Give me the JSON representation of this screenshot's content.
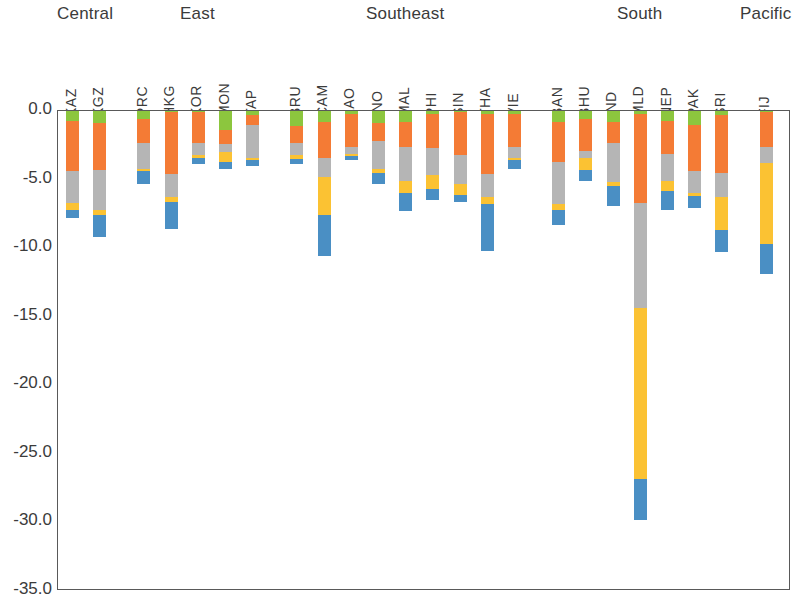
{
  "chart_data": {
    "type": "bar",
    "subtype": "stacked-bar-negative",
    "title": "",
    "xlabel": "",
    "ylabel": "",
    "ylim": [
      -35.0,
      0.0
    ],
    "ytick_labels": [
      "0.0",
      "-5.0",
      "-10.0",
      "-15.0",
      "-20.0",
      "-25.0",
      "-30.0",
      "-35.0"
    ],
    "ytick_values": [
      0.0,
      -5.0,
      -10.0,
      -15.0,
      -20.0,
      -25.0,
      -30.0,
      -35.0
    ],
    "grid": false,
    "legend": "none",
    "orientation": "vertical",
    "stack_order_top_to_bottom": [
      "green",
      "orange",
      "gray",
      "yellow",
      "blue"
    ],
    "colors": {
      "green": "#8CC63E",
      "orange": "#F47B35",
      "gray": "#B5B5B5",
      "yellow": "#FBC233",
      "blue": "#4A8FC4"
    },
    "groups": [
      {
        "label": "Central",
        "categories": [
          "KAZ",
          "KGZ"
        ]
      },
      {
        "label": "East",
        "categories": [
          "PRC",
          "HKG",
          "KOR",
          "MON",
          "TAP"
        ]
      },
      {
        "label": "Southeast",
        "categories": [
          "BRU",
          "CAM",
          "LAO",
          "INO",
          "MAL",
          "PHI",
          "SIN",
          "THA",
          "VIE"
        ]
      },
      {
        "label": "South",
        "categories": [
          "BAN",
          "BHU",
          "IND",
          "MLD",
          "NEP",
          "PAK",
          "SRI"
        ]
      },
      {
        "label": "Pacific",
        "categories": [
          "FIJ"
        ]
      }
    ],
    "categories": [
      "KAZ",
      "KGZ",
      "PRC",
      "HKG",
      "KOR",
      "MON",
      "TAP",
      "BRU",
      "CAM",
      "LAO",
      "INO",
      "MAL",
      "PHI",
      "SIN",
      "THA",
      "VIE",
      "BAN",
      "BHU",
      "IND",
      "MLD",
      "NEP",
      "PAK",
      "SRI",
      "FIJ"
    ],
    "series": [
      {
        "name": "green",
        "values": [
          -0.7,
          -0.9,
          -0.6,
          -0.1,
          -0.1,
          -1.4,
          -0.3,
          -1.1,
          -0.8,
          -0.2,
          -0.9,
          -0.8,
          -0.2,
          -0.1,
          -0.2,
          -0.2,
          -0.8,
          -0.6,
          -0.8,
          -0.2,
          -0.7,
          -1.0,
          -0.3,
          -0.1
        ]
      },
      {
        "name": "orange",
        "values": [
          -3.7,
          -3.4,
          -1.7,
          -4.5,
          -2.2,
          -1.0,
          -0.7,
          -1.2,
          -2.6,
          -2.4,
          -1.3,
          -1.8,
          -2.5,
          -3.1,
          -4.4,
          -2.4,
          -2.9,
          -2.3,
          -1.5,
          -6.5,
          -2.4,
          -3.4,
          -4.2,
          -2.5
        ]
      },
      {
        "name": "gray",
        "values": [
          -2.3,
          -2.9,
          -1.9,
          -1.7,
          -0.9,
          -0.6,
          -2.4,
          -0.9,
          -1.4,
          -0.5,
          -2.0,
          -2.5,
          -2.0,
          -2.1,
          -1.7,
          -0.8,
          -3.1,
          -0.5,
          -2.9,
          -7.7,
          -2.0,
          -1.6,
          -1.8,
          -1.2
        ]
      },
      {
        "name": "yellow",
        "values": [
          -0.5,
          -0.4,
          -0.2,
          -0.3,
          -0.2,
          -0.7,
          -0.2,
          -0.3,
          -2.8,
          -0.2,
          -0.3,
          -0.9,
          -1.0,
          -0.8,
          -0.5,
          -0.2,
          -0.4,
          -0.9,
          -0.3,
          -12.4,
          -0.7,
          -0.2,
          -2.4,
          -5.9
        ]
      },
      {
        "name": "blue",
        "values": [
          -0.6,
          -1.6,
          -0.9,
          -2.0,
          -0.5,
          -0.5,
          -0.4,
          -0.4,
          -3.0,
          -0.3,
          -0.8,
          -1.3,
          -0.8,
          -0.5,
          -3.4,
          -0.6,
          -1.1,
          -0.8,
          -1.4,
          -3.0,
          -1.4,
          -0.9,
          -1.6,
          -2.2
        ]
      }
    ]
  }
}
